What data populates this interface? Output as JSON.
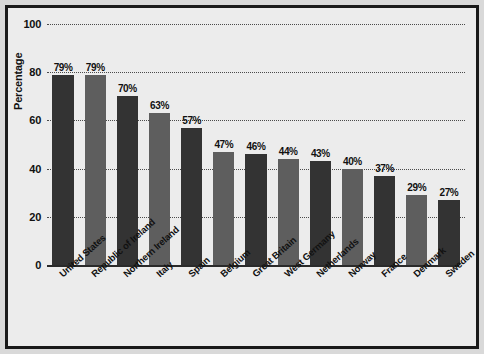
{
  "chart_data": {
    "type": "bar",
    "title": "",
    "xlabel": "",
    "ylabel": "Percentage",
    "ylim": [
      0,
      100
    ],
    "yticks": [
      0,
      20,
      40,
      60,
      80,
      100
    ],
    "grid": true,
    "legend": "none",
    "categories": [
      "United States",
      "Republic of Ireland",
      "Northern Ireland",
      "Italy",
      "Spain",
      "Belgium",
      "Great Britain",
      "West Germany",
      "Netherlands",
      "Norway",
      "France",
      "Denmark",
      "Sweden"
    ],
    "values": [
      79,
      79,
      70,
      63,
      57,
      47,
      46,
      44,
      43,
      40,
      37,
      29,
      27
    ],
    "value_labels": [
      "79%",
      "79%",
      "70%",
      "63%",
      "57%",
      "47%",
      "46%",
      "44%",
      "43%",
      "40%",
      "37%",
      "29%",
      "27%"
    ],
    "bar_colors": [
      "#333333",
      "#5e5e5e",
      "#333333",
      "#5e5e5e",
      "#333333",
      "#5e5e5e",
      "#333333",
      "#5e5e5e",
      "#333333",
      "#5e5e5e",
      "#333333",
      "#5e5e5e",
      "#333333"
    ]
  },
  "theme": {
    "page_background": "#d9d9d9",
    "plot_background": "#ececec",
    "frame_color": "#1a1a1a",
    "grid_color": "#4a4a4a",
    "axis_color": "#2a2a2a",
    "text_color": "#111111",
    "bar_dark": "#333333",
    "bar_light": "#5e5e5e"
  }
}
